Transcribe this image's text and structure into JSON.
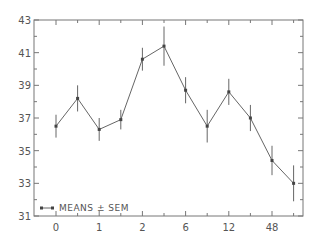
{
  "chart_data": {
    "type": "line",
    "title": "",
    "xlabel": "",
    "ylabel": "",
    "ylim": [
      31,
      43
    ],
    "yticks": [
      31,
      33,
      35,
      37,
      39,
      41,
      43
    ],
    "xtick_labels": [
      "0",
      "1",
      "2",
      "6",
      "12",
      "48"
    ],
    "x_positions": [
      0,
      0.5,
      1,
      1.5,
      2,
      2.5,
      3,
      3.5,
      4,
      4.5,
      5,
      5.5
    ],
    "series": [
      {
        "name": "MEANS ± SEM",
        "values": [
          36.5,
          38.2,
          36.3,
          36.9,
          40.6,
          41.4,
          38.7,
          36.5,
          38.6,
          37.0,
          34.4,
          33.0
        ],
        "errors": [
          0.7,
          0.8,
          0.7,
          0.6,
          0.7,
          1.2,
          0.8,
          1.0,
          0.8,
          0.8,
          0.9,
          1.1
        ]
      }
    ],
    "grid": false,
    "legend_position": "lower left"
  },
  "legend": {
    "label": "MEANS ± SEM"
  },
  "colors": {
    "line": "#666666",
    "axis": "#777777",
    "text": "#555555"
  }
}
